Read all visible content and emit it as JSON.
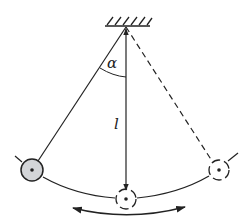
{
  "diagram": {
    "labels": {
      "angle": "α",
      "length": "l"
    },
    "colors": {
      "stroke": "#222222",
      "bob_fill": "#d3d5d8",
      "background": "#ffffff"
    },
    "elements": {
      "ceiling": "fixed support with hatching",
      "pivot": "suspension point",
      "string_displaced": "solid string to left bob",
      "string_vertical": "vertical length arrow l",
      "string_mirror": "dashed string to right bob",
      "bob_left": "filled gray bob (current position)",
      "bob_center": "dashed bob (equilibrium)",
      "bob_right": "dashed bob (opposite extreme)",
      "swing_path": "circular arc path",
      "motion_arrow": "double-headed oscillation arrow"
    }
  }
}
